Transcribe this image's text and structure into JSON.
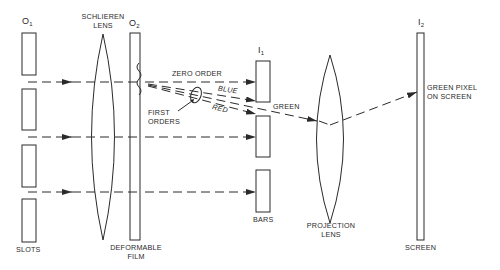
{
  "diagram": {
    "components": {
      "slots": {
        "symbol": "O",
        "index": "1",
        "label": "SLOTS"
      },
      "schlieren_lens": {
        "label_line1": "SCHLIEREN",
        "label_line2": "LENS"
      },
      "film": {
        "symbol": "O",
        "index": "2",
        "label_line1": "DEFORMABLE",
        "label_line2": "FILM"
      },
      "bars": {
        "symbol": "I",
        "index": "1",
        "label": "BARS"
      },
      "projection_lens": {
        "label_line1": "PROJECTION",
        "label_line2": "LENS"
      },
      "screen": {
        "symbol": "I",
        "index": "2",
        "label": "SCREEN"
      }
    },
    "beams": {
      "zero_order": "ZERO ORDER",
      "blue": "BLUE",
      "red": "RED",
      "green": "GREEN",
      "first_orders_line1": "FIRST",
      "first_orders_line2": "ORDERS"
    },
    "annotations": {
      "pixel_line1": "GREEN PIXEL",
      "pixel_line2": "ON SCREEN"
    },
    "colors": {
      "line": "#2a2a2a",
      "background": "#ffffff"
    }
  }
}
